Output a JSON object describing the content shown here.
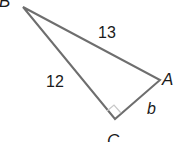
{
  "diagram": {
    "type": "right-triangle",
    "vertices": {
      "B": {
        "label": "B",
        "x": 23,
        "y": 7
      },
      "A": {
        "label": "A",
        "x": 160,
        "y": 80
      },
      "C": {
        "label": "C",
        "x": 115,
        "y": 119
      }
    },
    "sides": {
      "BA": {
        "label": "13"
      },
      "BC": {
        "label": "12"
      },
      "CA": {
        "label": "b"
      }
    },
    "right_angle_at": "C",
    "colors": {
      "stroke": "#6e6e6e",
      "right_angle_marker": "#c8c8c8",
      "text": "#1a1a1a"
    }
  }
}
